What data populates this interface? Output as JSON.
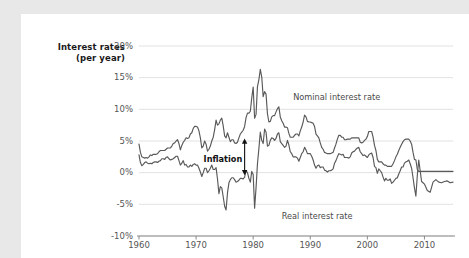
{
  "figure": {
    "background_color": "#ffffff",
    "page_background_color": "#e8e8e8",
    "line_color": "#595959",
    "grid_color": "#e2e2e2",
    "axis_color": "#8a8a8a"
  },
  "chart_data": {
    "type": "line",
    "title": "",
    "subtitle": "",
    "ylabel_line1": "Interest rates",
    "ylabel_line2": "(per year)",
    "xlabel": "",
    "ylim": [
      -10,
      20
    ],
    "xlim": [
      1960,
      2015
    ],
    "grid": "horizontal",
    "legend_position": "inline-annotations",
    "yticks": [
      20,
      15,
      10,
      5,
      0,
      -5,
      -10
    ],
    "ytick_labels": [
      "20%",
      "15%",
      "10%",
      "5%",
      "0%",
      "-5%",
      "-10%"
    ],
    "xticks": [
      1960,
      1970,
      1980,
      1990,
      2000,
      2010
    ],
    "xtick_labels": [
      "1960",
      "1970",
      "1980",
      "1990",
      "2000",
      "2010"
    ],
    "annotations": [
      {
        "name": "inflation",
        "text": "Inflation",
        "x": 1978.5,
        "y_top": 5.4,
        "y_bottom": -0.4,
        "style": "double-headed-arrow"
      },
      {
        "name": "nominal-label",
        "text": "Nominal interest rate",
        "x": 1987.0,
        "y": 12.0
      },
      {
        "name": "real-label",
        "text": "Real interest rate",
        "x": 1985.0,
        "y": -6.9
      }
    ],
    "series": [
      {
        "name": "Nominal interest rate",
        "color": "#595959",
        "x": [
          1960.0,
          1960.25,
          1960.5,
          1960.75,
          1961.0,
          1961.25,
          1961.5,
          1961.75,
          1962.0,
          1962.25,
          1962.5,
          1962.75,
          1963.0,
          1963.25,
          1963.5,
          1963.75,
          1964.0,
          1964.25,
          1964.5,
          1964.75,
          1965.0,
          1965.25,
          1965.5,
          1965.75,
          1966.0,
          1966.25,
          1966.5,
          1966.75,
          1967.0,
          1967.25,
          1967.5,
          1967.75,
          1968.0,
          1968.25,
          1968.5,
          1968.75,
          1969.0,
          1969.25,
          1969.5,
          1969.75,
          1970.0,
          1970.25,
          1970.5,
          1970.75,
          1971.0,
          1971.25,
          1971.5,
          1971.75,
          1972.0,
          1972.25,
          1972.5,
          1972.75,
          1973.0,
          1973.25,
          1973.5,
          1973.75,
          1974.0,
          1974.25,
          1974.5,
          1974.75,
          1975.0,
          1975.25,
          1975.5,
          1975.75,
          1976.0,
          1976.25,
          1976.5,
          1976.75,
          1977.0,
          1977.25,
          1977.5,
          1977.75,
          1978.0,
          1978.25,
          1978.5,
          1978.75,
          1979.0,
          1979.25,
          1979.5,
          1979.75,
          1980.0,
          1980.25,
          1980.5,
          1980.75,
          1981.0,
          1981.25,
          1981.5,
          1981.75,
          1982.0,
          1982.25,
          1982.5,
          1982.75,
          1983.0,
          1983.25,
          1983.5,
          1983.75,
          1984.0,
          1984.25,
          1984.5,
          1984.75,
          1985.0,
          1985.25,
          1985.5,
          1985.75,
          1986.0,
          1986.25,
          1986.5,
          1986.75,
          1987.0,
          1987.25,
          1987.5,
          1987.75,
          1988.0,
          1988.25,
          1988.5,
          1988.75,
          1989.0,
          1989.25,
          1989.5,
          1989.75,
          1990.0,
          1990.25,
          1990.5,
          1990.75,
          1991.0,
          1991.25,
          1991.5,
          1991.75,
          1992.0,
          1992.25,
          1992.5,
          1992.75,
          1993.0,
          1993.25,
          1993.5,
          1993.75,
          1994.0,
          1994.25,
          1994.5,
          1994.75,
          1995.0,
          1995.25,
          1995.5,
          1995.75,
          1996.0,
          1996.25,
          1996.5,
          1996.75,
          1997.0,
          1997.25,
          1997.5,
          1997.75,
          1998.0,
          1998.25,
          1998.5,
          1998.75,
          1999.0,
          1999.25,
          1999.5,
          1999.75,
          2000.0,
          2000.25,
          2000.5,
          2000.75,
          2001.0,
          2001.25,
          2001.5,
          2001.75,
          2002.0,
          2002.25,
          2002.5,
          2002.75,
          2003.0,
          2003.25,
          2003.5,
          2003.75,
          2004.0,
          2004.25,
          2004.5,
          2004.75,
          2005.0,
          2005.25,
          2005.5,
          2005.75,
          2006.0,
          2006.25,
          2006.5,
          2006.75,
          2007.0,
          2007.25,
          2007.5,
          2007.75,
          2008.0,
          2008.25,
          2008.5,
          2008.75,
          2009.0,
          2009.25,
          2009.5,
          2009.75,
          2010.0,
          2010.5,
          2011.0,
          2011.5,
          2012.0,
          2012.5,
          2013.0,
          2013.5,
          2014.0,
          2014.5,
          2015.0
        ],
        "values": [
          4.5,
          3.2,
          2.5,
          2.4,
          2.3,
          2.4,
          2.3,
          2.5,
          2.8,
          2.7,
          2.9,
          2.9,
          2.9,
          3.0,
          3.3,
          3.5,
          3.5,
          3.5,
          3.5,
          3.7,
          3.9,
          3.9,
          3.9,
          4.2,
          4.6,
          4.7,
          5.0,
          5.2,
          4.6,
          3.6,
          4.3,
          4.8,
          5.1,
          5.5,
          5.4,
          5.5,
          6.1,
          6.3,
          7.0,
          7.3,
          7.3,
          7.2,
          6.6,
          5.5,
          3.9,
          4.2,
          5.0,
          4.5,
          3.4,
          3.7,
          4.2,
          5.0,
          5.6,
          6.8,
          8.3,
          7.5,
          7.7,
          8.3,
          8.6,
          7.4,
          5.8,
          5.5,
          6.3,
          5.6,
          4.9,
          5.2,
          5.2,
          4.7,
          4.6,
          4.8,
          5.5,
          6.1,
          6.4,
          6.7,
          7.3,
          8.7,
          9.4,
          9.4,
          9.7,
          11.8,
          13.5,
          8.6,
          9.2,
          13.6,
          14.7,
          16.3,
          15.1,
          12.0,
          12.8,
          12.4,
          9.3,
          8.0,
          8.1,
          8.8,
          9.0,
          9.0,
          9.6,
          10.1,
          10.4,
          8.8,
          8.2,
          7.8,
          7.2,
          7.2,
          7.1,
          6.2,
          5.6,
          5.6,
          5.6,
          5.9,
          6.1,
          6.1,
          5.8,
          6.6,
          7.2,
          8.0,
          9.1,
          8.8,
          8.1,
          8.0,
          8.0,
          7.9,
          7.8,
          7.3,
          6.1,
          5.8,
          5.5,
          4.7,
          4.0,
          3.7,
          3.2,
          3.1,
          3.0,
          3.0,
          3.0,
          3.1,
          3.2,
          3.9,
          4.5,
          5.3,
          5.9,
          5.9,
          5.6,
          5.6,
          5.2,
          5.2,
          5.3,
          5.3,
          5.3,
          5.5,
          5.5,
          5.5,
          5.5,
          5.5,
          5.5,
          4.8,
          4.7,
          4.8,
          5.1,
          5.3,
          5.7,
          6.5,
          6.5,
          6.5,
          5.6,
          4.3,
          3.5,
          2.1,
          1.7,
          1.7,
          1.7,
          1.4,
          1.2,
          1.2,
          1.0,
          1.0,
          1.0,
          1.0,
          1.4,
          1.9,
          2.5,
          2.9,
          3.5,
          4.0,
          4.5,
          4.9,
          5.2,
          5.3,
          5.3,
          5.3,
          5.0,
          4.5,
          3.2,
          2.1,
          2.0,
          0.5,
          0.2,
          0.2,
          0.2,
          0.2,
          0.2,
          0.2,
          0.2,
          0.2,
          0.2,
          0.2,
          0.2,
          0.2,
          0.2,
          0.2,
          0.2
        ]
      },
      {
        "name": "Real interest rate",
        "color": "#595959",
        "x": [
          1960.0,
          1960.25,
          1960.5,
          1960.75,
          1961.0,
          1961.25,
          1961.5,
          1961.75,
          1962.0,
          1962.25,
          1962.5,
          1962.75,
          1963.0,
          1963.25,
          1963.5,
          1963.75,
          1964.0,
          1964.25,
          1964.5,
          1964.75,
          1965.0,
          1965.25,
          1965.5,
          1965.75,
          1966.0,
          1966.25,
          1966.5,
          1966.75,
          1967.0,
          1967.25,
          1967.5,
          1967.75,
          1968.0,
          1968.25,
          1968.5,
          1968.75,
          1969.0,
          1969.25,
          1969.5,
          1969.75,
          1970.0,
          1970.25,
          1970.5,
          1970.75,
          1971.0,
          1971.25,
          1971.5,
          1971.75,
          1972.0,
          1972.25,
          1972.5,
          1972.75,
          1973.0,
          1973.25,
          1973.5,
          1973.75,
          1974.0,
          1974.25,
          1974.5,
          1974.75,
          1975.0,
          1975.25,
          1975.5,
          1975.75,
          1976.0,
          1976.25,
          1976.5,
          1976.75,
          1977.0,
          1977.25,
          1977.5,
          1977.75,
          1978.0,
          1978.25,
          1978.5,
          1978.75,
          1979.0,
          1979.25,
          1979.5,
          1979.75,
          1980.0,
          1980.25,
          1980.5,
          1980.75,
          1981.0,
          1981.25,
          1981.5,
          1981.75,
          1982.0,
          1982.25,
          1982.5,
          1982.75,
          1983.0,
          1983.25,
          1983.5,
          1983.75,
          1984.0,
          1984.25,
          1984.5,
          1984.75,
          1985.0,
          1985.25,
          1985.5,
          1985.75,
          1986.0,
          1986.25,
          1986.5,
          1986.75,
          1987.0,
          1987.25,
          1987.5,
          1987.75,
          1988.0,
          1988.25,
          1988.5,
          1988.75,
          1989.0,
          1989.25,
          1989.5,
          1989.75,
          1990.0,
          1990.25,
          1990.5,
          1990.75,
          1991.0,
          1991.25,
          1991.5,
          1991.75,
          1992.0,
          1992.25,
          1992.5,
          1992.75,
          1993.0,
          1993.25,
          1993.5,
          1993.75,
          1994.0,
          1994.25,
          1994.5,
          1994.75,
          1995.0,
          1995.25,
          1995.5,
          1995.75,
          1996.0,
          1996.25,
          1996.5,
          1996.75,
          1997.0,
          1997.25,
          1997.5,
          1997.75,
          1998.0,
          1998.25,
          1998.5,
          1998.75,
          1999.0,
          1999.25,
          1999.5,
          1999.75,
          2000.0,
          2000.25,
          2000.5,
          2000.75,
          2001.0,
          2001.25,
          2001.5,
          2001.75,
          2002.0,
          2002.25,
          2002.5,
          2002.75,
          2003.0,
          2003.25,
          2003.5,
          2003.75,
          2004.0,
          2004.25,
          2004.5,
          2004.75,
          2005.0,
          2005.25,
          2005.5,
          2005.75,
          2006.0,
          2006.25,
          2006.5,
          2006.75,
          2007.0,
          2007.25,
          2007.5,
          2007.75,
          2008.0,
          2008.25,
          2008.5,
          2008.75,
          2009.0,
          2009.25,
          2009.5,
          2009.75,
          2010.0,
          2010.5,
          2011.0,
          2011.5,
          2012.0,
          2012.5,
          2013.0,
          2013.5,
          2014.0,
          2014.5,
          2015.0
        ],
        "values": [
          2.8,
          1.6,
          1.1,
          1.3,
          1.6,
          1.7,
          1.5,
          1.4,
          1.5,
          1.4,
          1.6,
          1.7,
          1.7,
          1.6,
          1.8,
          1.9,
          2.2,
          2.2,
          2.1,
          2.4,
          2.5,
          2.2,
          2.0,
          2.1,
          2.2,
          2.4,
          2.6,
          2.6,
          1.9,
          1.2,
          1.5,
          1.9,
          1.2,
          1.3,
          0.9,
          0.9,
          1.2,
          1.0,
          1.3,
          1.4,
          1.2,
          1.2,
          0.7,
          0.1,
          -0.6,
          0.0,
          0.7,
          0.7,
          0.0,
          0.3,
          0.7,
          1.2,
          0.5,
          0.5,
          0.8,
          -1.0,
          -3.3,
          -2.2,
          -2.4,
          -3.8,
          -5.3,
          -5.9,
          -3.2,
          -1.6,
          -1.1,
          -0.8,
          -0.8,
          -1.1,
          -1.5,
          -1.4,
          -1.2,
          -0.9,
          -0.9,
          -1.0,
          -0.7,
          0.3,
          0.0,
          -0.9,
          -1.5,
          0.2,
          -0.3,
          -5.6,
          -2.4,
          1.4,
          3.8,
          6.4,
          5.1,
          4.6,
          6.9,
          6.4,
          4.2,
          4.3,
          5.1,
          5.5,
          5.4,
          5.1,
          5.4,
          6.1,
          6.3,
          4.9,
          4.6,
          4.3,
          4.0,
          4.2,
          5.1,
          4.4,
          3.3,
          3.0,
          2.5,
          2.5,
          2.5,
          2.3,
          1.8,
          2.4,
          3.0,
          3.3,
          4.0,
          3.6,
          3.0,
          3.0,
          3.0,
          2.6,
          2.0,
          1.2,
          0.7,
          1.1,
          1.2,
          0.8,
          0.9,
          0.9,
          0.4,
          0.3,
          0.1,
          0.3,
          0.3,
          0.4,
          0.6,
          1.5,
          1.9,
          2.5,
          3.0,
          2.9,
          2.8,
          2.9,
          2.4,
          2.4,
          2.4,
          2.3,
          2.5,
          3.1,
          3.3,
          3.4,
          3.7,
          3.9,
          4.0,
          3.3,
          3.0,
          2.7,
          2.8,
          2.6,
          2.4,
          2.8,
          3.0,
          3.1,
          2.4,
          1.0,
          0.8,
          -0.1,
          0.6,
          0.3,
          0.0,
          -0.7,
          -1.3,
          -0.9,
          -1.2,
          -1.2,
          -1.0,
          -1.7,
          -1.5,
          -1.2,
          -0.9,
          -0.8,
          -0.2,
          0.3,
          0.9,
          0.9,
          1.5,
          1.7,
          1.8,
          2.0,
          1.4,
          0.7,
          -0.8,
          -2.4,
          -3.7,
          -0.4,
          2.0,
          0.3,
          -1.4,
          -1.6,
          -1.8,
          -2.8,
          -3.1,
          -1.5,
          -1.1,
          -1.5,
          -1.6,
          -1.4,
          -1.3,
          -1.6,
          -1.5
        ]
      }
    ]
  }
}
